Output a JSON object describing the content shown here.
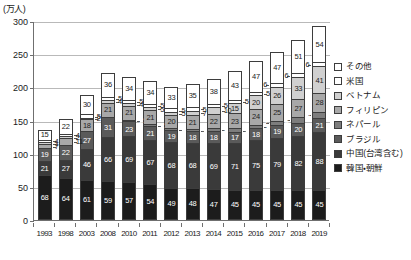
{
  "chart_data": {
    "type": "bar",
    "title": "",
    "xlabel": "",
    "ylabel": "(万人)",
    "ylim": [
      0,
      300
    ],
    "yticks": [
      0,
      50,
      100,
      150,
      200,
      250,
      300
    ],
    "grid": true,
    "legend_position": "right",
    "stacked": true,
    "categories": [
      "1993",
      "1998",
      "2003",
      "2008",
      "2010",
      "2011",
      "2012",
      "2013",
      "2014",
      "2015",
      "2016",
      "2017",
      "2018",
      "2019"
    ],
    "series": [
      {
        "name": "韓国・朝鮮",
        "key": "korea",
        "color": "#1c1c1c",
        "values": [
          68,
          64,
          61,
          59,
          57,
          54,
          49,
          48,
          47,
          45,
          45,
          45,
          45,
          45
        ]
      },
      {
        "name": "中国(台湾含む)",
        "key": "china",
        "color": "#3a3a3a",
        "values": [
          21,
          27,
          46,
          66,
          69,
          67,
          68,
          68,
          69,
          71,
          75,
          79,
          82,
          88
        ]
      },
      {
        "name": "ブラジル",
        "key": "brazil",
        "color": "#5a5a5a",
        "values": [
          19,
          22,
          27,
          31,
          23,
          21,
          19,
          18,
          18,
          17,
          18,
          19,
          20,
          21
        ]
      },
      {
        "name": "ネパール",
        "key": "nepal",
        "color": "#7d7d7d",
        "values": [
          0,
          0,
          0,
          0,
          2,
          2,
          2,
          3,
          4,
          5,
          6,
          7,
          8,
          9
        ]
      },
      {
        "name": "フィリピン",
        "key": "philippines",
        "color": "#a8a8a8",
        "values": [
          7,
          11,
          18,
          21,
          21,
          21,
          20,
          21,
          22,
          23,
          24,
          25,
          27,
          28
        ]
      },
      {
        "name": "ベトナム",
        "key": "vietnam",
        "color": "#d0d0d0",
        "values": [
          1,
          2,
          2,
          4,
          4,
          5,
          5,
          7,
          10,
          15,
          20,
          26,
          33,
          41
        ]
      },
      {
        "name": "米国",
        "key": "us",
        "color": "#ffffff",
        "values": [
          4,
          4,
          5,
          5,
          5,
          5,
          5,
          5,
          5,
          5,
          5,
          6,
          6,
          6
        ]
      },
      {
        "name": "その他",
        "key": "other",
        "color": "#ffffff",
        "values": [
          15,
          22,
          30,
          36,
          34,
          34,
          33,
          35,
          38,
          43,
          47,
          47,
          51,
          54
        ]
      }
    ],
    "stack_order_bottom_to_top": [
      "korea",
      "china",
      "brazil",
      "nepal",
      "philippines",
      "vietnam",
      "us",
      "other"
    ],
    "totals": [
      135,
      152,
      189,
      222,
      215,
      209,
      201,
      205,
      213,
      224,
      240,
      254,
      272,
      292
    ]
  },
  "legend": {
    "items": [
      {
        "label": "その他",
        "swatch": "#ffffff"
      },
      {
        "label": "米国",
        "swatch": "#ffffff"
      },
      {
        "label": "ベトナム",
        "swatch": "#d0d0d0"
      },
      {
        "label": "フィリピン",
        "swatch": "#a8a8a8"
      },
      {
        "label": "ネパール",
        "swatch": "#7d7d7d"
      },
      {
        "label": "ブラジル",
        "swatch": "#5a5a5a"
      },
      {
        "label": "中国(台湾含む)",
        "swatch": "#3a3a3a"
      },
      {
        "label": "韓国・朝鮮",
        "swatch": "#1c1c1c"
      }
    ]
  }
}
